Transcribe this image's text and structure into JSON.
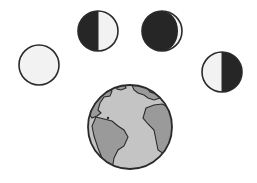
{
  "diagram": {
    "colors": {
      "dark": "#262626",
      "light": "#f2f2f2",
      "outline": "#2a2a2a",
      "ocean": "#c4c4c4",
      "land": "#9a9a9a",
      "background": "#ffffff"
    },
    "moons": [
      {
        "id": "full",
        "label": "Full moon",
        "cx": 39,
        "cy": 65,
        "r": 20
      },
      {
        "id": "first-quarter",
        "label": "Half moon, dark left",
        "cx": 98,
        "cy": 31,
        "r": 20
      },
      {
        "id": "crescent",
        "label": "Crescent moon, thin lit edge right",
        "cx": 162,
        "cy": 31,
        "r": 20
      },
      {
        "id": "last-quarter",
        "label": "Half moon, dark right",
        "cx": 222,
        "cy": 72,
        "r": 20
      }
    ],
    "earth": {
      "label": "Earth",
      "cx": 130,
      "cy": 127,
      "r": 42
    }
  }
}
